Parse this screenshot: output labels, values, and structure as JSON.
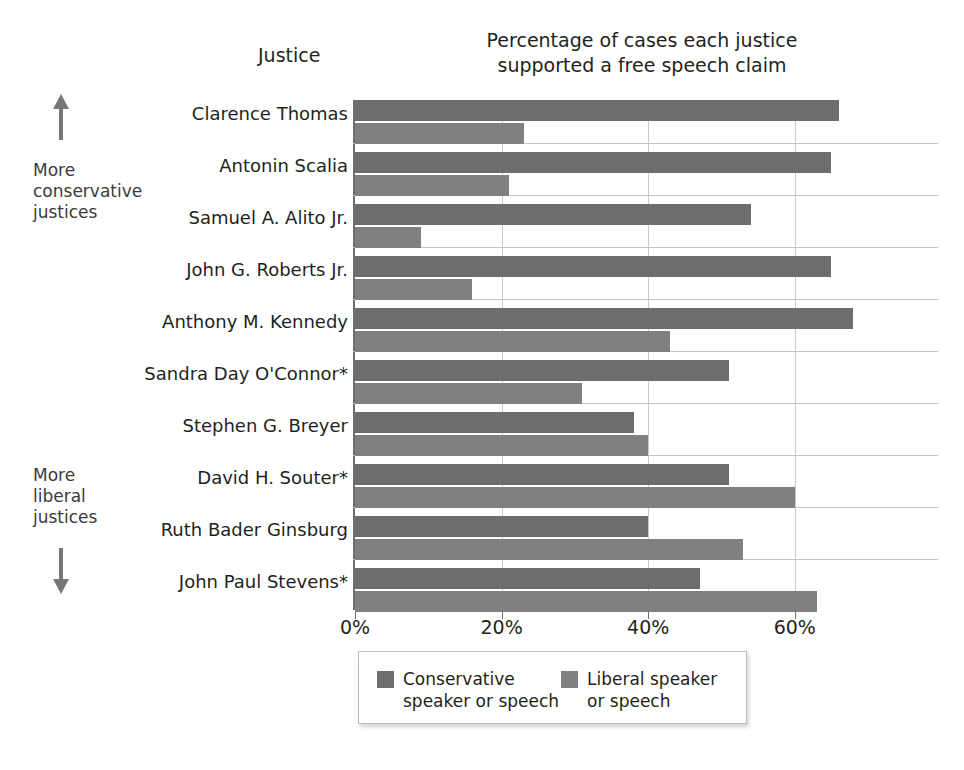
{
  "annotations": {
    "conservative_note": "More\nconservative\njustices",
    "liberal_note": "More\nliberal\njustices",
    "up_arrow_icon": "arrow-up-icon",
    "down_arrow_icon": "arrow-down-icon"
  },
  "column_header": "Justice",
  "chart_data": {
    "type": "bar",
    "orientation": "horizontal",
    "title": "Percentage of cases each justice supported a free speech claim",
    "xlabel": "",
    "ylabel": "Justice",
    "xlim": [
      0,
      70
    ],
    "xticks": [
      0,
      20,
      40,
      60
    ],
    "xtick_labels": [
      "0%",
      "20%",
      "40%",
      "60%"
    ],
    "grid": "vertical gridlines at ticks; light horizontal separators between justice groups",
    "legend_position": "below plot, centered",
    "categories": [
      "Clarence Thomas",
      "Antonin Scalia",
      "Samuel A. Alito Jr.",
      "John G. Roberts Jr.",
      "Anthony M. Kennedy",
      "Sandra Day O'Connor*",
      "Stephen G. Breyer",
      "David H. Souter*",
      "Ruth Bader Ginsburg",
      "John Paul Stevens*"
    ],
    "series": [
      {
        "name": "Conservative speaker or speech",
        "legend_label": "Conservative\nspeaker or speech",
        "color": "#6d6d6d",
        "values": [
          66,
          65,
          54,
          65,
          68,
          51,
          38,
          51,
          40,
          47
        ]
      },
      {
        "name": "Liberal speaker or speech",
        "legend_label": "Liberal speaker\nor speech",
        "color": "#808080",
        "values": [
          23,
          21,
          9,
          16,
          43,
          31,
          40,
          60,
          53,
          63
        ]
      }
    ]
  }
}
